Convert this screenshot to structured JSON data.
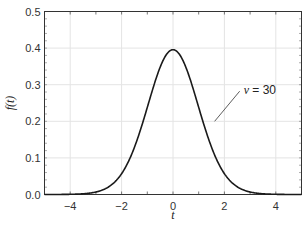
{
  "chart_data": {
    "type": "line",
    "title": "",
    "xlabel": "t",
    "ylabel": "f(t)",
    "xlim": [
      -5,
      5
    ],
    "ylim": [
      0,
      0.5
    ],
    "grid": true,
    "x_ticks": [
      -4,
      -2,
      0,
      2,
      4
    ],
    "x_tick_labels": [
      "−4",
      "−2",
      "0",
      "2",
      "4"
    ],
    "y_ticks": [
      0.0,
      0.1,
      0.2,
      0.3,
      0.4,
      0.5
    ],
    "y_tick_labels": [
      "0.0",
      "0.1",
      "0.2",
      "0.3",
      "0.4",
      "0.5"
    ],
    "series": [
      {
        "name": "ν = 30",
        "distribution": "Student t",
        "dof": 30,
        "color": "#1a1a1a",
        "x": [
          -5,
          -4.5,
          -4,
          -3.5,
          -3,
          -2.5,
          -2,
          -1.5,
          -1,
          -0.5,
          0,
          0.5,
          1,
          1.5,
          2,
          2.5,
          3,
          3.5,
          4,
          4.5,
          5
        ],
        "y": [
          0.0002,
          0.0006,
          0.0011,
          0.0029,
          0.0068,
          0.0194,
          0.0563,
          0.1265,
          0.2379,
          0.3474,
          0.3956,
          0.3474,
          0.2379,
          0.1265,
          0.0563,
          0.0194,
          0.0068,
          0.0029,
          0.0011,
          0.0006,
          0.0002
        ]
      }
    ],
    "annotations": [
      {
        "text_symbol": "ν",
        "text_rest": " = 30",
        "x": 2.75,
        "y": 0.285,
        "arrow_to": [
          1.62,
          0.2
        ]
      }
    ]
  }
}
